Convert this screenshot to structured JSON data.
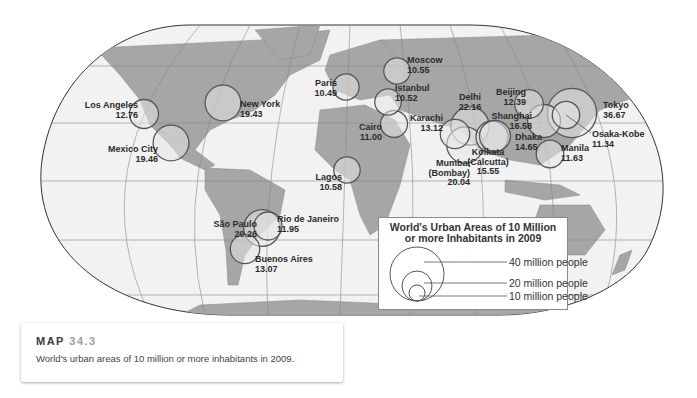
{
  "map": {
    "title": "World's Urban Areas of 10 Million or more Inhabitants in 2009",
    "colors": {
      "ocean": "#f2f2f2",
      "land": "#a6a6a6",
      "circle_stroke": "#555555",
      "circle_fill": "#e6e6e6"
    },
    "cities": [
      {
        "name": "Los Angeles",
        "value": "12.76"
      },
      {
        "name": "New York",
        "value": "19.43"
      },
      {
        "name": "Mexico City",
        "value": "19.46"
      },
      {
        "name": "Paris",
        "value": "10.49"
      },
      {
        "name": "Moscow",
        "value": "10.55"
      },
      {
        "name": "Istanbul",
        "value": "10.52"
      },
      {
        "name": "Cairo",
        "value": "11.00"
      },
      {
        "name": "Lagos",
        "value": "10.58"
      },
      {
        "name": "Karachi",
        "value": "13.12"
      },
      {
        "name": "Delhi",
        "value": "22.16"
      },
      {
        "name": "Mumbai (Bombay)",
        "value": "20.04"
      },
      {
        "name": "Kolkata (Calcutta)",
        "value": "15.55"
      },
      {
        "name": "Dhaka",
        "value": "14.65"
      },
      {
        "name": "Beijing",
        "value": "12.39"
      },
      {
        "name": "Shanghai",
        "value": "16.58"
      },
      {
        "name": "Tokyo",
        "value": "36.67"
      },
      {
        "name": "Osaka-Kobe",
        "value": "11.34"
      },
      {
        "name": "Manila",
        "value": "11.63"
      },
      {
        "name": "São Paulo",
        "value": "20.26"
      },
      {
        "name": "Rio de Janeiro",
        "value": "11.95"
      },
      {
        "name": "Buenos Aires",
        "value": "13.07"
      }
    ]
  },
  "legend": {
    "title_line1": "World's Urban Areas of 10 Million",
    "title_line2": "or more Inhabitants in 2009",
    "items": [
      {
        "label": "40 million people",
        "value": 40
      },
      {
        "label": "20 million people",
        "value": 20
      },
      {
        "label": "10 million people",
        "value": 10
      }
    ]
  },
  "caption": {
    "label": "MAP",
    "number": "34.3",
    "text": "World's urban areas of 10 million or more inhabitants in 2009."
  }
}
